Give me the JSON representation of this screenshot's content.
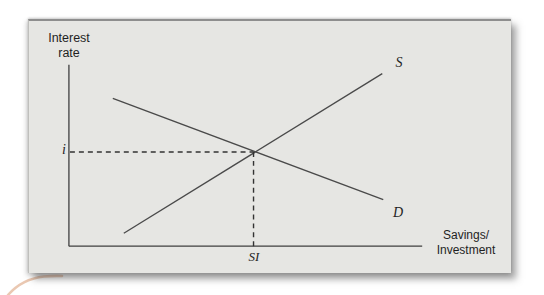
{
  "figure": {
    "y_axis_title_line1": "Interest",
    "y_axis_title_line2": "rate",
    "x_axis_title_line1": "Savings/",
    "x_axis_title_line2": "Investment",
    "labels": {
      "equilibrium_rate": "i",
      "supply_curve": "S",
      "demand_curve": "D",
      "equilibrium_quantity": "SI"
    }
  },
  "colors": {
    "panel_background": "#e6e6e3",
    "panel_edge": "#8e8e8e",
    "axis_line": "#3f3f3f",
    "curve_line": "#4a4a4a",
    "dashed_guide": "#333333",
    "text": "#1f1f1f",
    "decoration_swoosh": "#e8c2aa"
  },
  "chart_data": {
    "type": "line",
    "title": "",
    "xlabel": "Savings/Investment",
    "ylabel": "Interest rate",
    "axes_numeric": false,
    "series": [
      {
        "name": "S",
        "slope": "positive"
      },
      {
        "name": "D",
        "slope": "negative"
      }
    ],
    "equilibrium": {
      "y_label": "i",
      "x_label": "SI"
    },
    "lines": {
      "y_axis": {
        "x1": 40,
        "y1": 44,
        "x2": 40,
        "y2": 227,
        "color": "#3f3f3f",
        "width": 1.3
      },
      "x_axis": {
        "x1": 40,
        "y1": 227,
        "x2": 394,
        "y2": 227,
        "color": "#3f3f3f",
        "width": 1.3
      },
      "supply": {
        "x1": 95,
        "y1": 214,
        "x2": 354,
        "y2": 53,
        "color": "#4a4a4a",
        "width": 1.3
      },
      "demand": {
        "x1": 84,
        "y1": 78,
        "x2": 355,
        "y2": 180,
        "color": "#4a4a4a",
        "width": 1.3
      },
      "guide_horizontal": {
        "x1": 41,
        "y1": 132,
        "x2": 225,
        "y2": 132,
        "color": "#333333",
        "width": 1.4,
        "dashed": true
      },
      "guide_vertical": {
        "x1": 225,
        "y1": 132,
        "x2": 225,
        "y2": 227,
        "color": "#333333",
        "width": 1.4,
        "dashed": true
      }
    }
  }
}
